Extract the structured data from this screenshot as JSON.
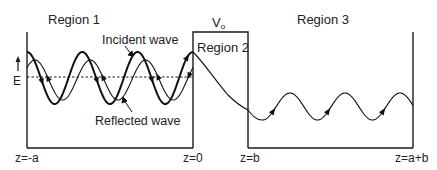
{
  "diagram": {
    "type": "potential-barrier-wave",
    "regions": [
      {
        "label": "Region 1"
      },
      {
        "label": "Region 2"
      },
      {
        "label": "Region 3"
      }
    ],
    "barrier": {
      "label_main": "V",
      "label_sub": "o"
    },
    "energy_label": "E",
    "waves": {
      "incident_label": "Incident wave",
      "reflected_label": "Reflected wave"
    },
    "positions": [
      {
        "label": "z=-a"
      },
      {
        "label": "z=0"
      },
      {
        "label": "z=b"
      },
      {
        "label": "z=a+b"
      }
    ],
    "colors": {
      "line": "#1a1a1a",
      "text": "#222222",
      "background": "#ffffff"
    }
  }
}
